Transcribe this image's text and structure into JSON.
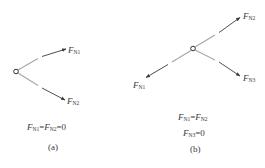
{
  "colors": {
    "member": "#a8a8a8",
    "force": "#3a3a3a",
    "text": "#3a3a3a",
    "background": "#ffffff"
  },
  "panels": [
    {
      "id": "a",
      "caption": "(a)",
      "forces": [
        {
          "symbol": "F",
          "subscript": "N1"
        },
        {
          "symbol": "F",
          "subscript": "N2"
        }
      ],
      "equations": [
        {
          "parts": [
            {
              "sym": "F",
              "sub": "N1"
            },
            {
              "op": "="
            },
            {
              "sym": "F",
              "sub": "N2"
            },
            {
              "op": "=0"
            }
          ]
        }
      ]
    },
    {
      "id": "b",
      "caption": "(b)",
      "forces": [
        {
          "symbol": "F",
          "subscript": "N1"
        },
        {
          "symbol": "F",
          "subscript": "N2"
        },
        {
          "symbol": "F",
          "subscript": "N3"
        }
      ],
      "equations": [
        {
          "parts": [
            {
              "sym": "F",
              "sub": "N1"
            },
            {
              "op": "="
            },
            {
              "sym": "F",
              "sub": "N2"
            }
          ]
        },
        {
          "parts": [
            {
              "sym": "F",
              "sub": "N3"
            },
            {
              "op": "=0"
            }
          ]
        }
      ]
    }
  ]
}
